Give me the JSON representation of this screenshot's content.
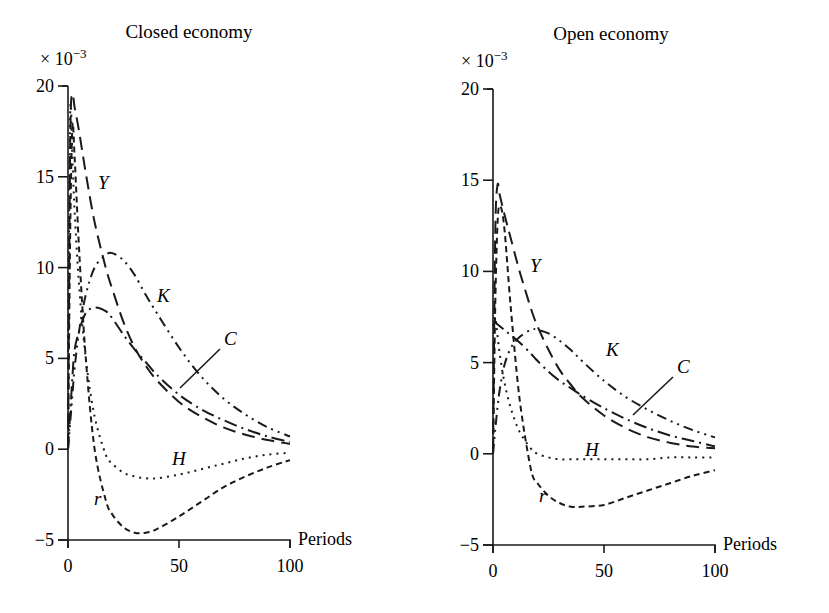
{
  "figure": {
    "panels": [
      {
        "title": "Closed economy",
        "scale_label": "× 10",
        "scale_exp": "−3",
        "x_axis_label": "Periods",
        "x_ticks": [
          "0",
          "50",
          "100"
        ],
        "y_ticks": [
          "20",
          "15",
          "10",
          "5",
          "0",
          "−5"
        ],
        "series_labels": {
          "Y": "Y",
          "K": "K",
          "C": "C",
          "H": "H",
          "r": "r"
        }
      },
      {
        "title": "Open economy",
        "scale_label": "× 10",
        "scale_exp": "−3",
        "x_axis_label": "Periods",
        "x_ticks": [
          "0",
          "50",
          "100"
        ],
        "y_ticks": [
          "20",
          "15",
          "10",
          "5",
          "0",
          "−5"
        ],
        "series_labels": {
          "Y": "Y",
          "K": "K",
          "C": "C",
          "H": "H",
          "r": "r"
        }
      }
    ]
  },
  "chart_data": [
    {
      "type": "line",
      "title": "Closed economy",
      "xlabel": "Periods",
      "ylabel": "× 10^-3",
      "xlim": [
        0,
        100
      ],
      "ylim": [
        -5,
        20
      ],
      "x_ticks": [
        0,
        50,
        100
      ],
      "y_ticks": [
        -5,
        0,
        5,
        10,
        15,
        20
      ],
      "grid": false,
      "legend": "inline labels",
      "x": [
        0,
        1,
        2,
        3,
        5,
        8,
        12,
        17,
        20,
        25,
        30,
        35,
        40,
        50,
        60,
        70,
        80,
        90,
        100
      ],
      "series": [
        {
          "name": "Y",
          "style": "long-dash",
          "values": [
            0,
            17,
            19.5,
            18.8,
            17.5,
            15.2,
            12.5,
            10,
            8.8,
            7,
            5.6,
            4.6,
            3.8,
            2.6,
            1.8,
            1.2,
            0.8,
            0.5,
            0.3
          ]
        },
        {
          "name": "C",
          "style": "dash-dot",
          "values": [
            0,
            2,
            4,
            5.5,
            6.5,
            7.5,
            7.8,
            7.6,
            7.2,
            6.3,
            5.5,
            4.8,
            4.1,
            3,
            2.2,
            1.6,
            1.1,
            0.7,
            0.4
          ]
        },
        {
          "name": "K",
          "style": "dash-dot-dot",
          "values": [
            0,
            1.5,
            3,
            4.5,
            6.5,
            8.5,
            10,
            10.7,
            10.8,
            10.4,
            9.6,
            8.5,
            7.5,
            5.6,
            4,
            2.8,
            1.9,
            1.2,
            0.7
          ]
        },
        {
          "name": "H",
          "style": "dotted",
          "values": [
            5,
            18.5,
            16,
            13,
            9,
            5,
            1.8,
            -0.3,
            -0.8,
            -1.3,
            -1.5,
            -1.6,
            -1.6,
            -1.4,
            -1.1,
            -0.8,
            -0.5,
            -0.3,
            -0.2
          ]
        },
        {
          "name": "r",
          "style": "short-dash",
          "values": [
            0,
            12,
            17.8,
            16,
            11,
            5,
            0,
            -2.8,
            -3.6,
            -4.3,
            -4.6,
            -4.6,
            -4.4,
            -3.7,
            -2.9,
            -2.1,
            -1.5,
            -1,
            -0.6
          ]
        }
      ],
      "annotations": [
        "Y",
        "K",
        "C",
        "H",
        "r"
      ]
    },
    {
      "type": "line",
      "title": "Open economy",
      "xlabel": "Periods",
      "ylabel": "× 10^-3",
      "xlim": [
        0,
        100
      ],
      "ylim": [
        -5,
        20
      ],
      "x_ticks": [
        0,
        50,
        100
      ],
      "y_ticks": [
        -5,
        0,
        5,
        10,
        15,
        20
      ],
      "grid": false,
      "legend": "inline labels",
      "x": [
        0,
        1,
        2,
        3,
        5,
        8,
        12,
        17,
        20,
        25,
        30,
        35,
        40,
        50,
        60,
        70,
        80,
        90,
        100
      ],
      "series": [
        {
          "name": "Y",
          "style": "long-dash",
          "values": [
            0,
            12,
            14.7,
            14.2,
            13.2,
            11.8,
            10,
            8,
            7,
            5.7,
            4.6,
            3.8,
            3.1,
            2.1,
            1.4,
            0.9,
            0.6,
            0.4,
            0.3
          ]
        },
        {
          "name": "C",
          "style": "dash-dot",
          "values": [
            7.2,
            7.2,
            7.1,
            7,
            6.8,
            6.5,
            6.1,
            5.5,
            5.1,
            4.5,
            4,
            3.6,
            3.2,
            2.5,
            1.9,
            1.4,
            1,
            0.7,
            0.4
          ]
        },
        {
          "name": "K",
          "style": "dash-dot-dot",
          "values": [
            0,
            1.3,
            2.5,
            3.5,
            4.8,
            5.8,
            6.4,
            6.8,
            6.8,
            6.6,
            6.2,
            5.7,
            5.1,
            4,
            3.1,
            2.4,
            1.8,
            1.3,
            0.9
          ]
        },
        {
          "name": "H",
          "style": "dotted",
          "values": [
            7,
            7.5,
            6.5,
            5.5,
            4,
            2.5,
            1.2,
            0.3,
            0,
            -0.2,
            -0.3,
            -0.3,
            -0.3,
            -0.3,
            -0.3,
            -0.3,
            -0.2,
            -0.2,
            -0.2
          ]
        },
        {
          "name": "r",
          "style": "short-dash",
          "values": [
            0,
            8,
            12.5,
            13.6,
            12.5,
            8,
            3,
            -0.8,
            -1.6,
            -2.3,
            -2.7,
            -2.9,
            -2.9,
            -2.8,
            -2.4,
            -2,
            -1.6,
            -1.2,
            -0.9
          ]
        }
      ],
      "annotations": [
        "Y",
        "K",
        "C",
        "H",
        "r"
      ]
    }
  ]
}
